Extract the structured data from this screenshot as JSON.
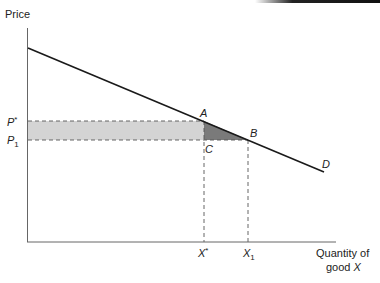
{
  "diagram": {
    "type": "supply-demand",
    "axes": {
      "y_label": "Price",
      "x_label_line1": "Quantity of",
      "x_label_line2": "good ",
      "x_label_var": "X"
    },
    "price_labels": {
      "p_star": "P",
      "p_star_sup": "*",
      "p1": "P",
      "p1_sub": "1"
    },
    "quantity_labels": {
      "x_star": "X",
      "x_star_sup": "*",
      "x1": "X",
      "x1_sub": "1"
    },
    "points": {
      "a": "A",
      "b": "B",
      "c": "C"
    },
    "curve_label": "D",
    "colors": {
      "rectangle_fill": "#d4d4d4",
      "triangle_fill": "#7a7a7a",
      "line": "#1a1a1a",
      "dash": "#555555",
      "axis": "#666666"
    }
  }
}
